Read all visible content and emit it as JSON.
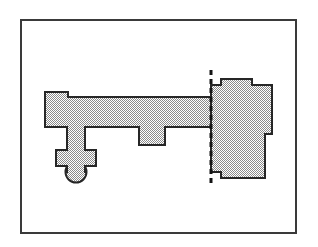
{
  "figure": {
    "kind": "architectural-plan-drawing",
    "title": "",
    "caption": "",
    "background_color": "#ffffff",
    "frame": {
      "name": "plot-frame",
      "x": 21,
      "y": 20,
      "width": 275,
      "height": 213,
      "stroke_color": "#3a3a3a",
      "stroke_width": 1.4,
      "fill": "none"
    },
    "style": {
      "outline_color": "#262626",
      "outline_width": 2.0,
      "fill_pattern": "checkerboard-dither-50",
      "fill_light": "#ffffff",
      "fill_dark": "#8a8a8a",
      "fill_flat_color": "#b8b8b8",
      "section_line_color": "#141414",
      "section_line_width": 3.0,
      "section_dash": "5,4"
    },
    "shapes": [
      {
        "name": "nave-and-bow-polygon",
        "role": "western-range-with-projecting-bow",
        "points": "45,92 68,92 68,97 211,97 211,127 165,127 165,145 139,145 139,127 85,127 85,150 96,150 96,166 85,166 85,172 67,172 67,166 56,166 56,150 67,150 67,127 45,127"
      },
      {
        "name": "apse-bump-semicircle",
        "role": "southern-rounded-projection",
        "center_x": 76,
        "center_y": 172,
        "radius": 10.5,
        "start_angle_deg": 0,
        "end_angle_deg": 180
      },
      {
        "name": "east-block-polygon",
        "role": "eastern-chancel-block",
        "points": "211,85 221,85 221,79 252,79 252,85 272,85 272,134 265,134 265,178 221,178 221,172 211,172"
      }
    ],
    "section_line": {
      "name": "section-cut-line",
      "orientation": "vertical",
      "x": 211,
      "y_top": 70,
      "y_bottom": 186
    }
  }
}
